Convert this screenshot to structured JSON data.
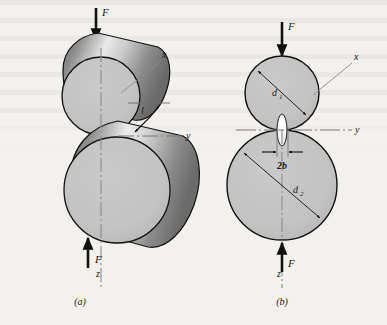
{
  "figure": {
    "background_color": "#f2f1ee",
    "body_fill": "#c3c3c3",
    "outline_color": "#111111",
    "contact_patch_fill": "#ffffff"
  },
  "panel_a": {
    "caption": "(a)",
    "type": "pictorial-3d-view",
    "labels": {
      "force_top": "F",
      "force_bottom": "F",
      "axis_x": "x",
      "axis_y": "y",
      "axis_z": "z",
      "contact_length": "l"
    }
  },
  "panel_b": {
    "caption": "(b)",
    "type": "orthographic-section-view",
    "labels": {
      "force_top": "F",
      "force_bottom": "F",
      "axis_x": "x",
      "axis_y": "y",
      "axis_z": "z",
      "diameter_upper": "d",
      "diameter_upper_sub": "1",
      "diameter_lower": "d",
      "diameter_lower_sub": "2",
      "contact_width": "2b"
    }
  }
}
